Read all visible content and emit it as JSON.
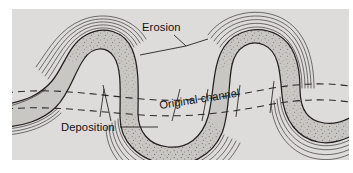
{
  "figure": {
    "kind": "geology-diagram",
    "panel_background": "#dedcda",
    "page_background": "#ffffff"
  },
  "labels": {
    "erosion": "Erosion",
    "deposition": "Deposition",
    "original_channel": "Original channel"
  },
  "colors": {
    "channel_fill": "#c9c7c4",
    "channel_outline": "#231f20",
    "erosion_arc": "#3a3637",
    "deposition_stipple": "#6b6764",
    "dashed_channel": "#2b2829",
    "leader_line": "#1a1718",
    "text": "#111111"
  },
  "legend_semantics": [
    {
      "key": "erosion",
      "label": "Erosion",
      "描述": "concentric arcs on outer bank (cut bank)"
    },
    {
      "key": "deposition",
      "label": "Deposition",
      "描述": "stippled point bar on inner bank"
    },
    {
      "key": "original_channel",
      "label": "Original channel",
      "描述": "pair of dashed lines"
    }
  ]
}
